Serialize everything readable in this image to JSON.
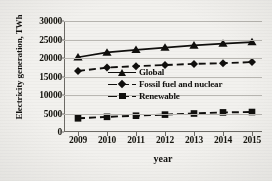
{
  "chart_data": {
    "type": "line",
    "title": "",
    "xlabel": "year",
    "ylabel": "Electricity generation, TWh",
    "categories": [
      "2009",
      "2010",
      "2011",
      "2012",
      "2013",
      "2014",
      "2015"
    ],
    "x": [
      2009,
      2010,
      2011,
      2012,
      2013,
      2014,
      2015
    ],
    "ylim": [
      0,
      30000
    ],
    "ytick_labels": [
      "0",
      "5000",
      "10000",
      "15000",
      "20000",
      "25000",
      "30000"
    ],
    "ytick_values": [
      0,
      5000,
      10000,
      15000,
      20000,
      25000,
      30000
    ],
    "grid": "horizontal",
    "legend_position": "center-right inside plot",
    "series": [
      {
        "name": "Global",
        "marker": "triangle",
        "line_style": "solid",
        "color": "#100f0d",
        "values": [
          20200,
          21500,
          22200,
          22800,
          23400,
          23900,
          24300
        ]
      },
      {
        "name": "Fossil fuel and nuclear",
        "marker": "diamond",
        "line_style": "dashed",
        "color": "#100f0d",
        "values": [
          16500,
          17400,
          17800,
          18100,
          18400,
          18600,
          18900
        ]
      },
      {
        "name": "Renewable",
        "marker": "square",
        "line_style": "dashed",
        "color": "#100f0d",
        "values": [
          3700,
          4100,
          4400,
          4700,
          5000,
          5300,
          5400
        ]
      }
    ]
  }
}
